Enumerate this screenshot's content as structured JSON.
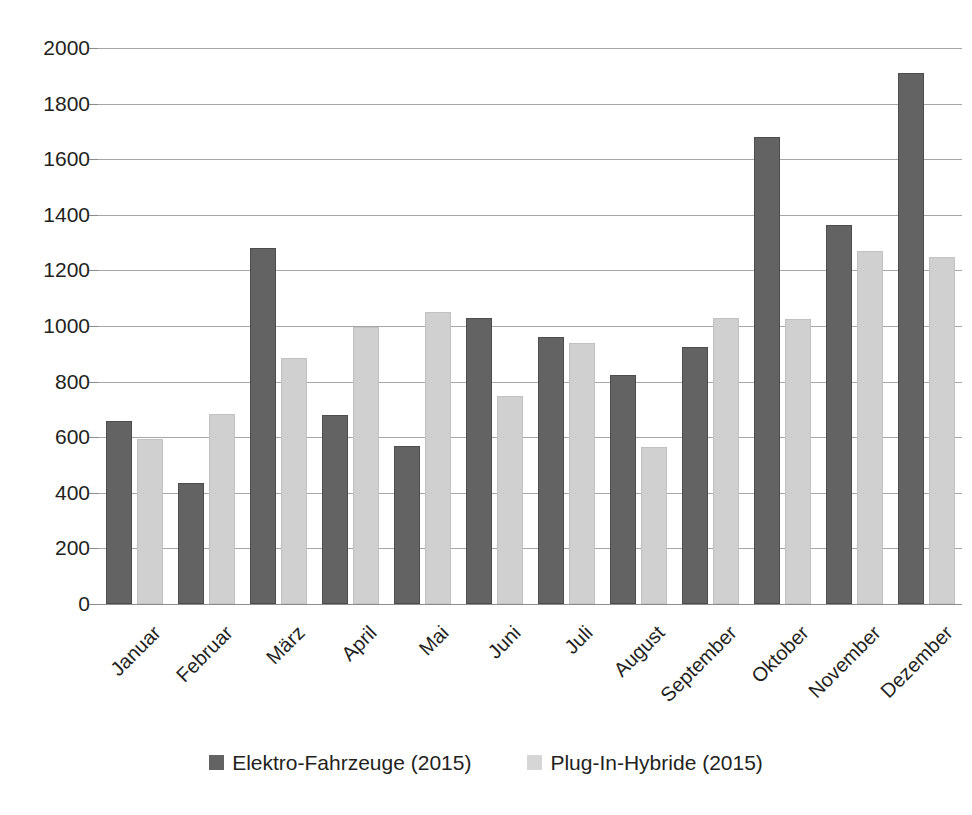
{
  "chart_data": {
    "type": "bar",
    "title": "",
    "subtitle": "",
    "xlabel": "",
    "ylabel": "",
    "ylim": [
      0,
      2000
    ],
    "ytick_step": 200,
    "yticks": [
      "2000",
      "1800",
      "1600",
      "1400",
      "1200",
      "1000",
      "800",
      "600",
      "400",
      "200",
      "0"
    ],
    "grid": true,
    "legend_position": "bottom",
    "categories": [
      "Januar",
      "Februar",
      "März",
      "April",
      "Mai",
      "Juni",
      "Juli",
      "August",
      "September",
      "Oktober",
      "November",
      "Dezember"
    ],
    "series": [
      {
        "name": "Elektro-Fahrzeuge (2015)",
        "color": "#636363",
        "values": [
          660,
          435,
          1280,
          680,
          570,
          1030,
          960,
          825,
          925,
          1680,
          1365,
          1910
        ]
      },
      {
        "name": "Plug-In-Hybride (2015)",
        "color": "#d0d0d0",
        "values": [
          595,
          685,
          885,
          995,
          1050,
          750,
          940,
          565,
          1030,
          1025,
          1270,
          1250
        ]
      }
    ]
  },
  "legend": {
    "items": [
      {
        "label": "Elektro-Fahrzeuge (2015)",
        "color": "#636363"
      },
      {
        "label": "Plug-In-Hybride (2015)",
        "color": "#d6d6d6"
      }
    ]
  },
  "colors": {
    "series_dark": "#636363",
    "series_light": "#d0d0d0",
    "gridline": "#a6a6a6",
    "text": "#231f20",
    "background": "#ffffff"
  }
}
